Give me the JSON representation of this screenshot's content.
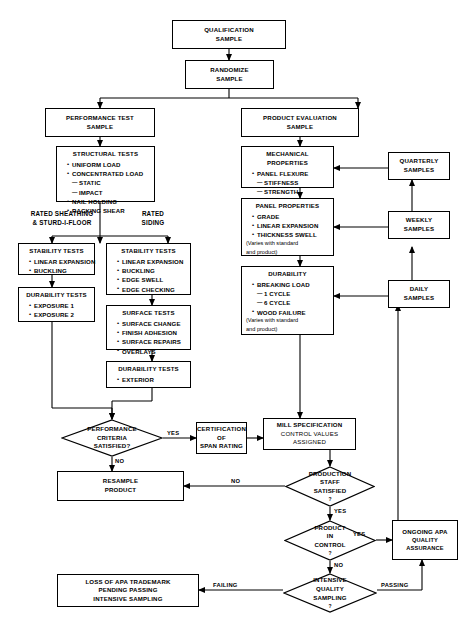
{
  "diagram": {
    "nodes": {
      "qualification_sample": {
        "line1": "QUALIFICATION",
        "line2": "SAMPLE"
      },
      "randomize_sample": {
        "line1": "RANDOMIZE",
        "line2": "SAMPLE"
      },
      "performance_test_sample": {
        "line1": "PERFORMANCE TEST",
        "line2": "SAMPLE"
      },
      "product_evaluation_sample": {
        "line1": "PRODUCT EVALUATION",
        "line2": "SAMPLE"
      },
      "structural_tests": {
        "header": "STRUCTURAL TESTS",
        "items": [
          {
            "type": "bullet",
            "text": "UNIFORM LOAD"
          },
          {
            "type": "bullet",
            "text": "CONCENTRATED LOAD"
          },
          {
            "type": "dash",
            "text": "STATIC"
          },
          {
            "type": "dash",
            "text": "IMPACT"
          },
          {
            "type": "bullet",
            "text": "NAIL HOLDING"
          },
          {
            "type": "bullet",
            "text": "RACKING SHEAR"
          }
        ]
      },
      "mechanical_properties": {
        "header": "MECHANICAL PROPERTIES",
        "items": [
          {
            "type": "bullet",
            "text": "PANEL FLEXURE"
          },
          {
            "type": "dash",
            "text": "STIFFNESS"
          },
          {
            "type": "dash",
            "text": "STRENGTH"
          }
        ]
      },
      "panel_properties": {
        "header": "PANEL PROPERTIES",
        "items": [
          {
            "type": "bullet",
            "text": "GRADE"
          },
          {
            "type": "bullet",
            "text": "LINEAR EXPANSION"
          },
          {
            "type": "bullet",
            "text": "THICKNESS SWELL"
          }
        ],
        "note1": "(Varies with standard",
        "note2": "and product)"
      },
      "durability": {
        "header": "DURABILITY",
        "items": [
          {
            "type": "bullet",
            "text": "BREAKING LOAD"
          },
          {
            "type": "dash",
            "text": "1 CYCLE"
          },
          {
            "type": "dash",
            "text": "6 CYCLE"
          },
          {
            "type": "bullet",
            "text": "WOOD FAILURE"
          }
        ],
        "note1": "(Varies with standard",
        "note2": "and product)"
      },
      "stability_tests_left": {
        "header": "STABILITY TESTS",
        "items": [
          {
            "type": "bullet",
            "text": "LINEAR EXPANSION"
          },
          {
            "type": "bullet",
            "text": "BUCKLING"
          }
        ]
      },
      "durability_tests_left": {
        "header": "DURABILITY TESTS",
        "items": [
          {
            "type": "bullet",
            "text": "EXPOSURE 1"
          },
          {
            "type": "bullet",
            "text": "EXPOSURE 2"
          }
        ]
      },
      "stability_tests_right": {
        "header": "STABILITY TESTS",
        "items": [
          {
            "type": "bullet",
            "text": "LINEAR EXPANSION"
          },
          {
            "type": "bullet",
            "text": "BUCKLING"
          },
          {
            "type": "bullet",
            "text": "EDGE SWELL"
          },
          {
            "type": "bullet",
            "text": "EDGE CHECKING"
          }
        ]
      },
      "surface_tests": {
        "header": "SURFACE TESTS",
        "items": [
          {
            "type": "bullet",
            "text": "SURFACE CHANGE"
          },
          {
            "type": "bullet",
            "text": "FINISH ADHESION"
          },
          {
            "type": "bullet",
            "text": "SURFACE REPAIRS"
          },
          {
            "type": "bullet",
            "text": "OVERLAYS"
          }
        ]
      },
      "durability_tests_right": {
        "header": "DURABILITY TESTS",
        "items": [
          {
            "type": "bullet",
            "text": "EXTERIOR"
          }
        ]
      },
      "quarterly_samples": {
        "line1": "QUARTERLY",
        "line2": "SAMPLES"
      },
      "weekly_samples": {
        "line1": "WEEKLY",
        "line2": "SAMPLES"
      },
      "daily_samples": {
        "line1": "DAILY",
        "line2": "SAMPLES"
      },
      "performance_criteria": {
        "line1": "PERFORMANCE",
        "line2": "CRITERIA",
        "line3": "SATISFIED?"
      },
      "certification_span_rating": {
        "line1": "CERTIFICATION",
        "line2": "OF",
        "line3": "SPAN RATING"
      },
      "mill_specification": {
        "line1": "MILL SPECIFICATION",
        "line2": "CONTROL VALUES",
        "line3": "ASSIGNED"
      },
      "resample_product": {
        "line1": "RESAMPLE",
        "line2": "PRODUCT"
      },
      "production_staff": {
        "line1": "PRODUCTION",
        "line2": "STAFF",
        "line3": "SATISFIED",
        "line4": "?"
      },
      "product_in_control": {
        "line1": "PRODUCT",
        "line2": "IN",
        "line3": "CONTROL",
        "line4": "?"
      },
      "ongoing_apa": {
        "line1": "ONGOING APA",
        "line2": "QUALITY ASSURANCE"
      },
      "intensive_quality_sampling": {
        "line1": "INTENSIVE",
        "line2": "QUALITY",
        "line3": "SAMPLING",
        "line4": "?"
      },
      "loss_of_trademark": {
        "line1": "LOSS OF APA TRADEMARK",
        "line2": "PENDING PASSING",
        "line3": "INTENSIVE SAMPLING"
      }
    },
    "branch_labels": {
      "rated_sheathing": {
        "line1": "RATED SHEATHING",
        "line2": "& STURD-I-FLOOR"
      },
      "rated_siding": {
        "line1": "RATED",
        "line2": "SIDING"
      }
    },
    "edge_labels": {
      "yes_performance": "YES",
      "no_performance": "NO",
      "no_production": "NO",
      "yes_production": "YES",
      "yes_control": "YES",
      "no_control": "NO",
      "failing": "FAILING",
      "passing": "PASSING"
    },
    "colors": {
      "line": "#000000",
      "background": "#ffffff"
    }
  }
}
